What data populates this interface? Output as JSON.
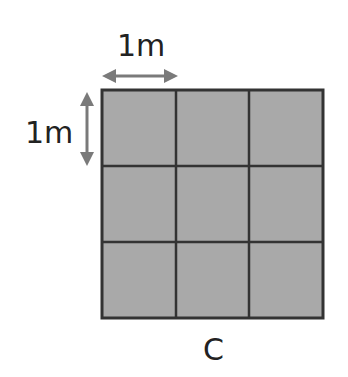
{
  "diagram": {
    "top_label": "1m",
    "left_label": "1m",
    "caption": "C",
    "grid": {
      "rows": 3,
      "cols": 3,
      "fill": "#a9a9a9",
      "line": "#333333"
    },
    "arrow_color": "#7a7a7a"
  }
}
